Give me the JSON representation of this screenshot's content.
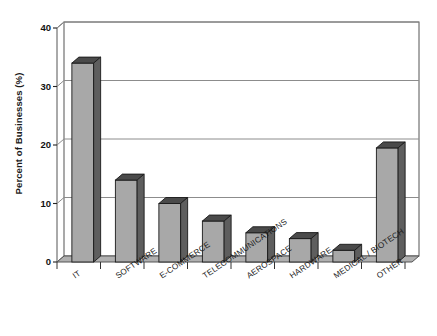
{
  "chart_data": {
    "type": "bar",
    "title": "",
    "subtitle": "",
    "xlabel": "",
    "ylabel": "Percent of Businesses (%)",
    "ylim": [
      0,
      40
    ],
    "yticks": [
      0,
      10,
      20,
      30,
      40
    ],
    "ytick_labels": [
      "0",
      "10",
      "20",
      "30",
      "40"
    ],
    "grid": true,
    "grid_axis": "y",
    "legend": false,
    "legend_position": "none",
    "style": "3d-bars",
    "bar_face_color": "#a8a8a8",
    "bar_side_color": "#5e5e5e",
    "bar_top_color": "#4a4a4a",
    "bar_edge_color": "#1a1a1a",
    "axis_color": "#555555",
    "grid_color": "#8c8c8c",
    "background_color": "#ffffff",
    "categories": [
      "IT",
      "SOFTWARE",
      "E-COMMERCE",
      "TELECOMMUNICATIONS",
      "AEROSPACE",
      "HARDWARE",
      "MEDICAL / BIOTECH",
      "OTHER"
    ],
    "values": [
      34,
      14,
      10,
      7,
      5,
      4,
      2,
      19.5
    ]
  }
}
